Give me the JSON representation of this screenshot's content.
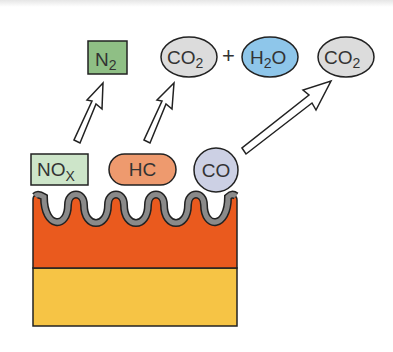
{
  "diagram": {
    "type": "catalytic-converter-surface-reaction",
    "colors": {
      "n2_fill": "#8fbf85",
      "nox_fill": "#cde5c9",
      "hc_fill": "#ee9a6e",
      "co_fill": "#ccd0e4",
      "co2_fill": "#dcdcdc",
      "h2o_fill": "#8ec6ea",
      "washcoat_fill": "#8a8a8a",
      "catalyst_fill": "#ea5a1e",
      "substrate_fill": "#f6c445",
      "outline": "#222222"
    },
    "products": {
      "n2": {
        "base": "N",
        "sub": "2"
      },
      "co2_left": {
        "base": "CO",
        "sub": "2"
      },
      "plus": "+",
      "h2o": {
        "pre": "H",
        "sub": "2",
        "post": "O"
      },
      "co2_right": {
        "base": "CO",
        "sub": "2"
      }
    },
    "reactants": {
      "nox": {
        "base": "NO",
        "sub": "X"
      },
      "hc": {
        "label": "HC"
      },
      "co": {
        "label": "CO"
      }
    },
    "arrows": [
      {
        "from": "NOx",
        "to": "N2"
      },
      {
        "from": "HC",
        "to": "CO2 + H2O"
      },
      {
        "from": "CO",
        "to": "CO2"
      }
    ]
  }
}
